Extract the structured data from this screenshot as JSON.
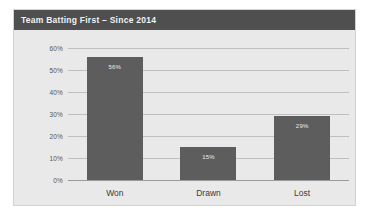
{
  "chart_data": {
    "type": "bar",
    "title": "Team Batting First – Since 2014",
    "categories": [
      "Won",
      "Drawn",
      "Lost"
    ],
    "values": [
      56,
      15,
      29
    ],
    "value_labels": [
      "56%",
      "15%",
      "29%"
    ],
    "xlabel": "",
    "ylabel": "",
    "ylim": [
      0,
      60
    ],
    "ytick_labels": [
      "60%",
      "50%",
      "40%",
      "30%",
      "20%",
      "10%",
      "0%"
    ],
    "ytick_values": [
      60,
      50,
      40,
      30,
      20,
      10,
      0
    ],
    "grid": true,
    "legend": false,
    "units": "percent",
    "colors": {
      "bar": "#5d5d5d",
      "title_bar": "#4f4f4f",
      "title_text": "#f2f2f2",
      "plot_background": "#e9e9e9",
      "gridline": "#bfbfbf",
      "axis_line": "#9a9a9a",
      "tick_label": "#555555",
      "category_label": "#3a3a3a",
      "value_label": "#ededed"
    }
  }
}
